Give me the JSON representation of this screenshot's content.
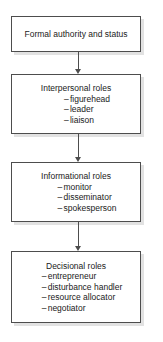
{
  "diagram": {
    "type": "flowchart",
    "orientation": "vertical",
    "colors": {
      "box_border": "#4d4d4d",
      "box_fill": "#ffffff",
      "shadow": "#e2e2e2",
      "text": "#1a1a1a",
      "arrow": "#4d4d4d"
    },
    "nodes": [
      {
        "title": "Formal authority and status",
        "items": []
      },
      {
        "title": "Interpersonal roles",
        "items": [
          "figurehead",
          "leader",
          "liaison"
        ]
      },
      {
        "title": "Informational roles",
        "items": [
          "monitor",
          "disseminator",
          "spokesperson"
        ]
      },
      {
        "title": "Decisional roles",
        "items": [
          "entrepreneur",
          "disturbance handler",
          "resource allocator",
          "negotiator"
        ]
      }
    ],
    "connectors": [
      {
        "from": "Formal authority and status",
        "to": "Interpersonal roles",
        "arrowhead": "down"
      },
      {
        "from": "Interpersonal roles",
        "to": "Informational roles",
        "arrowhead": "down"
      },
      {
        "from": "Informational roles",
        "to": "Decisional roles",
        "arrowhead": "down"
      }
    ],
    "bullet_marker": "–"
  }
}
